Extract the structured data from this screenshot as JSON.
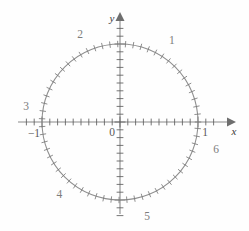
{
  "figure": {
    "background_color": "#fefefe",
    "line_color": "#8a8a8a",
    "label_color": "#7c7c7c",
    "axis_label_color": "#3a3a3a"
  },
  "axes": {
    "x_axis_label": "x",
    "y_axis_label": "y",
    "origin_label": "0",
    "x_left_label": "−1",
    "x_right_label": "1"
  },
  "arc_labels": [
    {
      "text": "1",
      "radians": 1
    },
    {
      "text": "2",
      "radians": 2
    },
    {
      "text": "3",
      "radians": 3
    },
    {
      "text": "4",
      "radians": 4
    },
    {
      "text": "5",
      "radians": 5
    },
    {
      "text": "6",
      "radians": 6
    }
  ],
  "chart_data": {
    "type": "scatter",
    "xlabel": "x",
    "ylabel": "y",
    "xlim": [
      -1.35,
      1.35
    ],
    "ylim": [
      -1.3,
      1.3
    ],
    "grid": false,
    "legend": null,
    "circle": {
      "center": [
        0,
        0
      ],
      "radius": 1,
      "description": "unit circle"
    },
    "axis_tick_spacing": 0.1,
    "circle_tick_arc_spacing": 0.1,
    "annotations": [
      {
        "label": "1",
        "arc_length_radians": 1,
        "x": 0.5403,
        "y": 0.8415
      },
      {
        "label": "2",
        "arc_length_radians": 2,
        "x": -0.4161,
        "y": 0.9093
      },
      {
        "label": "3",
        "arc_length_radians": 3,
        "x": -0.99,
        "y": 0.1411
      },
      {
        "label": "4",
        "arc_length_radians": 4,
        "x": -0.6536,
        "y": -0.7568
      },
      {
        "label": "5",
        "arc_length_radians": 5,
        "x": 0.2837,
        "y": -0.9589
      },
      {
        "label": "6",
        "arc_length_radians": 6,
        "x": 0.9602,
        "y": -0.2794
      }
    ],
    "x_tick_labels": [
      {
        "value": -1,
        "text": "−1"
      },
      {
        "value": 0,
        "text": "0"
      },
      {
        "value": 1,
        "text": "1"
      }
    ],
    "y_tick_labels": []
  }
}
